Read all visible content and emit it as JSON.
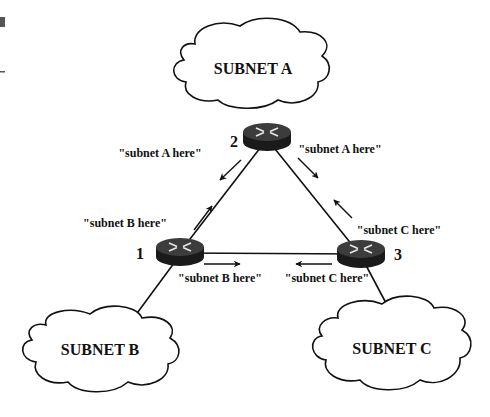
{
  "diagram": {
    "clouds": [
      {
        "id": "A",
        "label": "SUBNET A"
      },
      {
        "id": "B",
        "label": "SUBNET B"
      },
      {
        "id": "C",
        "label": "SUBNET C"
      }
    ],
    "routers": [
      {
        "id": "1",
        "number": "1"
      },
      {
        "id": "2",
        "number": "2"
      },
      {
        "id": "3",
        "number": "3"
      }
    ],
    "advertisements": {
      "r2_to_r1": "\"subnet A here\"",
      "r2_to_r3": "\"subnet A here\"",
      "r1_to_r2": "\"subnet B here\"",
      "r1_to_r3": "\"subnet B here\"",
      "r3_to_r2": "\"subnet C here\"",
      "r3_to_r1": "\"subnet C here\""
    },
    "colors": {
      "stroke": "#111111",
      "router_top": "#3a3a3a",
      "router_side": "#1a1a1a"
    }
  }
}
